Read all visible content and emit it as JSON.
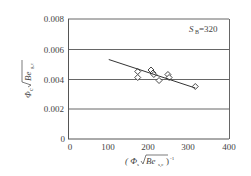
{
  "chart_data": {
    "type": "scatter",
    "title": "",
    "annotation": "S_B=320",
    "annotation_main": "S",
    "annotation_sub": "B",
    "annotation_value": "=320",
    "xlabel": "( Φ_s/√Be_{s,c} )^{-1}",
    "ylabel": "Φ_c/√Be_{g,c}",
    "xlim": [
      0,
      400
    ],
    "ylim": [
      0,
      0.008
    ],
    "x_ticks": [
      0,
      100,
      200,
      300,
      400
    ],
    "y_ticks": [
      0,
      0.002,
      0.004,
      0.006,
      0.008
    ],
    "x_tick_labels": [
      "0",
      "100",
      "200",
      "300",
      "400"
    ],
    "y_tick_labels": [
      "0",
      "0.002",
      "0.004",
      "0.006",
      "0.008"
    ],
    "grid": "horizontal",
    "legend": null,
    "series": [
      {
        "name": "data",
        "marker": "diamond-open",
        "points": [
          {
            "x": 172,
            "y": 0.0045
          },
          {
            "x": 172,
            "y": 0.0041
          },
          {
            "x": 205,
            "y": 0.0046
          },
          {
            "x": 210,
            "y": 0.0044
          },
          {
            "x": 212,
            "y": 0.0043
          },
          {
            "x": 225,
            "y": 0.0039
          },
          {
            "x": 247,
            "y": 0.0043
          },
          {
            "x": 250,
            "y": 0.0041
          },
          {
            "x": 315,
            "y": 0.0035
          }
        ]
      },
      {
        "name": "fit",
        "type": "line",
        "points": [
          {
            "x": 100,
            "y": 0.0053
          },
          {
            "x": 315,
            "y": 0.0034
          }
        ]
      }
    ]
  },
  "labels": {
    "y_axis_phi": "Φ",
    "y_axis_sub": "c",
    "y_axis_root": "Be",
    "y_axis_root_sub": "g,c",
    "x_axis_open": "( Φ",
    "x_axis_sub": "s",
    "x_axis_root": "Be",
    "x_axis_root_sub": "s,c",
    "x_axis_close": ")",
    "x_axis_exp": "-1",
    "annotation_S": "S",
    "annotation_B": "B",
    "annotation_val": "=320"
  }
}
